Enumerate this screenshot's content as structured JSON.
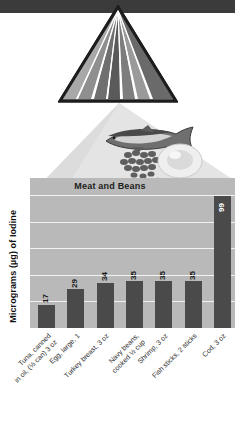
{
  "graphic": {
    "top_band": "#3b3b3b",
    "pyramid_name": "food-guide-pyramid",
    "pyramid_stripes": [
      "#a8a8a8",
      "#8f8f8f",
      "#6f6f6f",
      "#5a5a5a",
      "#7d7d7d",
      "#9a9a9a",
      "#6a6a6a"
    ],
    "photo_items": [
      "fish",
      "beans",
      "egg"
    ]
  },
  "chart_data": {
    "type": "bar",
    "title": "Meat and Beans",
    "xlabel": "",
    "ylabel": "Micrograms (µg) of Iodine",
    "ylim": [
      0,
      100
    ],
    "gridlines": [
      20,
      40,
      60,
      80,
      100
    ],
    "grid": true,
    "legend": "none",
    "bar_color": "#4a4a4a",
    "plot_background": "#b9b9b9",
    "categories": [
      "Tuna, canned in oil, (½ can) 3 oz",
      "Egg, large, 1",
      "Turkey breast, 3 oz",
      "Navy beans, cooked ½ cup",
      "Shrimp, 3 oz",
      "Fish sticks, 2 sticks",
      "Cod, 3 oz"
    ],
    "category_lines": [
      [
        "Tuna, canned",
        "in oil, (½ can) 3 oz"
      ],
      [
        "Egg, large, 1",
        ""
      ],
      [
        "Turkey breast, 3 oz",
        ""
      ],
      [
        "Navy beans,",
        "cooked ½ cup"
      ],
      [
        "Shrimp, 3 oz",
        ""
      ],
      [
        "Fish sticks, 2 sticks",
        ""
      ],
      [
        "Cod, 3 oz",
        ""
      ]
    ],
    "values": [
      17,
      29,
      34,
      35,
      35,
      35,
      99
    ]
  }
}
